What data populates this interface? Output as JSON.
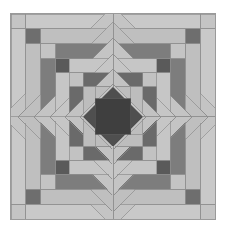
{
  "artwork": {
    "title": "Pineapple quilt block",
    "description": "Grayscale concentric octagonal pineapple quilt block composed of alternating light and dark trapezoid strips radiating from a central dark diamond with an inner darker square.",
    "canvas": {
      "width": 226,
      "height": 233,
      "background_color": "#ffffff"
    },
    "block": {
      "x": 10,
      "y": 13,
      "width": 206,
      "height": 207,
      "border_color": "#9a9a9a",
      "base_color": "#c9c9c9"
    },
    "palette": {
      "background": "#ffffff",
      "light": "#c9c9c9",
      "light_alt": "#bdbdbd",
      "mid": "#9c9c9c",
      "mid_dark": "#7b7b7b",
      "dark": "#636363",
      "darker": "#4f4f4f",
      "darkest": "#3c3c3c",
      "outline": "#8d8d8d",
      "center_diamond": "#4f4f4f",
      "center_square": "#3f3f3f"
    },
    "geometry": {
      "center_x": 103,
      "center_y": 103.5,
      "ring_count": 6,
      "symmetry": "4-fold rotational / octagonal",
      "rings": [
        {
          "index": 0,
          "name": "corner-triangles",
          "half_width": 103,
          "corner_color": "#c4c4c4",
          "edge_color": "#c9c9c9"
        },
        {
          "index": 1,
          "name": "ring-1-dark-diagonals",
          "half_width": 88,
          "corner_color": "#6e6e6e",
          "edge_color": "#bfbfbf"
        },
        {
          "index": 2,
          "name": "ring-2-light",
          "half_width": 73,
          "corner_color": "#c4c4c4",
          "edge_color": "#7d7d7d"
        },
        {
          "index": 3,
          "name": "ring-3-dark",
          "half_width": 58,
          "corner_color": "#5a5a5a",
          "edge_color": "#c6c6c6"
        },
        {
          "index": 4,
          "name": "ring-4-light",
          "half_width": 44,
          "corner_color": "#c2c2c2",
          "edge_color": "#6a6a6a"
        },
        {
          "index": 5,
          "name": "ring-5-dark",
          "half_width": 30,
          "corner_color": "#575757",
          "edge_color": "#c7c7c7"
        },
        {
          "index": 6,
          "name": "ring-6-light",
          "half_width": 18,
          "corner_color": "#c4c4c4",
          "edge_color": "#bdbdbd"
        }
      ],
      "center_diamond_radius": 30,
      "center_square_half": 18
    }
  },
  "chart_data": {
    "type": "other",
    "note": "Decorative geometric pattern; no quantitative data."
  }
}
